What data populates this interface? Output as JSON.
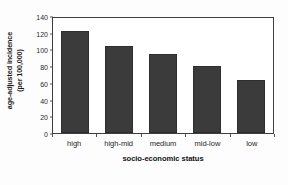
{
  "chart_data": {
    "type": "bar",
    "title": "",
    "subtitle": "",
    "xlabel": "socio-economic status",
    "ylabel_line1": "age-adjusted incidence",
    "ylabel_line2": "(per 100,000)",
    "categories": [
      "high",
      "high-mid",
      "medium",
      "mid-low",
      "low"
    ],
    "values": [
      122,
      104,
      94,
      80,
      63
    ],
    "ylim": [
      0,
      140
    ],
    "yticks": [
      0,
      20,
      40,
      60,
      80,
      100,
      120,
      140
    ],
    "ytick_labels": [
      "0",
      "20",
      "40",
      "60",
      "80",
      "100",
      "120",
      "140"
    ],
    "grid": false,
    "legend": false,
    "legend_position": "none",
    "bar_color": "#3b3b3b",
    "frame_color": "#3f3f3f",
    "background_color": "#ffffff"
  }
}
